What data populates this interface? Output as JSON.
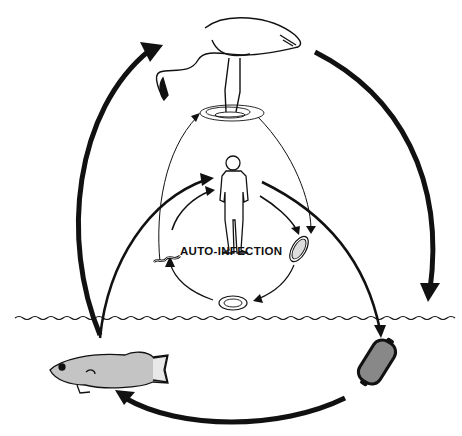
{
  "diagram": {
    "type": "life-cycle",
    "colors": {
      "ink": "#111111",
      "background": "#ffffff"
    },
    "hosts": [
      {
        "id": "bird",
        "name": "wading bird (heron/crane) standing in water",
        "role": "host"
      },
      {
        "id": "human",
        "name": "human",
        "role": "host"
      },
      {
        "id": "fish",
        "name": "fish",
        "role": "intermediate host"
      }
    ],
    "stages": [
      {
        "id": "egg-upper",
        "name": "egg (in host)"
      },
      {
        "id": "egg-lower",
        "name": "egg (near water surface)"
      },
      {
        "id": "egg-water",
        "name": "embryonated egg in water"
      },
      {
        "id": "larva",
        "name": "larva / worm"
      }
    ],
    "labels": {
      "auto_infection": "AUTO-INFECTION"
    },
    "cycle_arrows": [
      "fish -> bird",
      "bird -> water egg",
      "water egg -> fish",
      "fish -> human",
      "human -> egg",
      "bird -> egg",
      "egg -> egg (lower)",
      "egg (lower) -> larva",
      "larva -> human",
      "human -> water egg"
    ],
    "water_line": "wavy horizontal line"
  }
}
